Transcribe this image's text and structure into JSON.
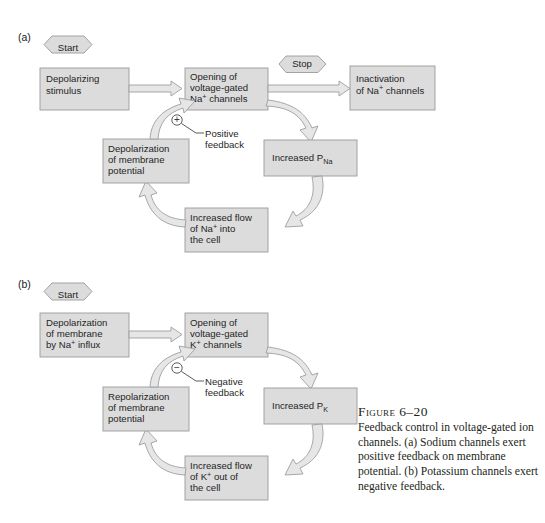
{
  "figure": {
    "caption_title": "Figure 6–20",
    "caption_body": "Feedback control in voltage-gated ion channels. (a) Sodium channels exert positive feedback on membrane potential. (b) Potassium channels exert negative feedback.",
    "colors": {
      "box_fill": "#dcdcdc",
      "box_stroke": "#9a9a9a",
      "arrow_fill": "#e2e2e2",
      "arrow_stroke": "#9e9e9e",
      "text": "#1f1f1f",
      "background": "#ffffff"
    }
  },
  "panel_a": {
    "label": "(a)",
    "start_label": "Start",
    "stop_label": "Stop",
    "stimulus": {
      "line1": "Depolarizing",
      "line2": "stimulus"
    },
    "opening": {
      "line1": "Opening of",
      "line2": "voltage-gated",
      "line3_pre": "Na",
      "line3_sup": "+",
      "line3_post": " channels"
    },
    "inactivation": {
      "line1": "Inactivation",
      "line2_pre": "of Na",
      "line2_sup": "+",
      "line2_post": " channels"
    },
    "increased_p": {
      "text_pre": "Increased P",
      "text_sub": "Na"
    },
    "increased_flow": {
      "line1": "Increased flow",
      "line2_pre": "of Na",
      "line2_sup": "+",
      "line2_post": " into",
      "line3": "the cell"
    },
    "depolarization": {
      "line1": "Depolarization",
      "line2": "of membrane",
      "line3": "potential"
    },
    "feedback_sign": "+",
    "feedback": {
      "line1": "Positive",
      "line2": "feedback"
    }
  },
  "panel_b": {
    "label": "(b)",
    "start_label": "Start",
    "depol_membrane": {
      "line1": "Depolarization",
      "line2": "of membrane",
      "line3_pre": "by Na",
      "line3_sup": "+",
      "line3_post": " influx"
    },
    "opening": {
      "line1": "Opening of",
      "line2": "voltage-gated",
      "line3_pre": "K",
      "line3_sup": "+",
      "line3_post": " channels"
    },
    "increased_p": {
      "text_pre": "Increased P",
      "text_sub": "K"
    },
    "increased_flow": {
      "line1": "Increased flow",
      "line2_pre": "of K",
      "line2_sup": "+",
      "line2_post": " out of",
      "line3": "the cell"
    },
    "repolarization": {
      "line1": "Repolarization",
      "line2": "of membrane",
      "line3": "potential"
    },
    "feedback_sign": "−",
    "feedback": {
      "line1": "Negative",
      "line2": "feedback"
    }
  }
}
